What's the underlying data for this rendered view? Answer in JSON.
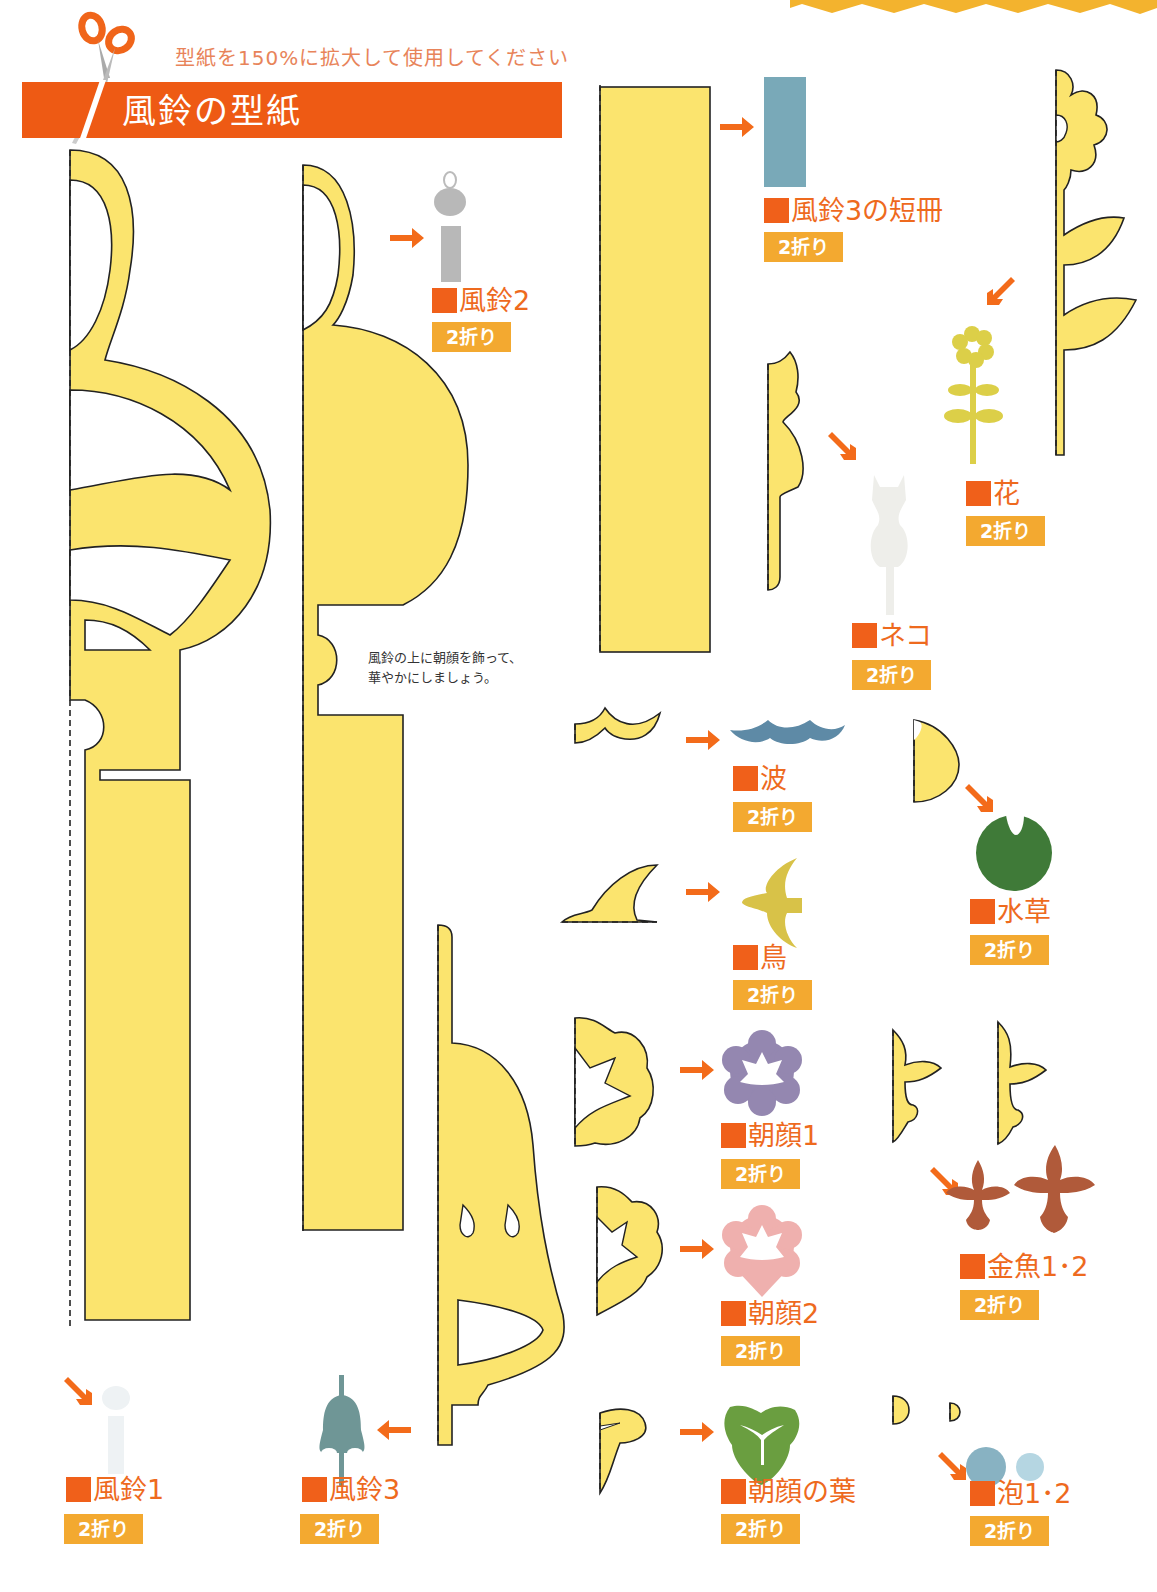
{
  "header": {
    "instruction": "型紙を150%に拡大して使用してください",
    "title": "風鈴の型紙",
    "icon": "scissors-icon"
  },
  "note": {
    "text": "風鈴の上に朝顔を飾って、\n華やかにしましょう。"
  },
  "fold_label": "2折り",
  "colors": {
    "template_fill": "#fbe46e",
    "title_band": "#ee5a14",
    "label_orange": "#ee6a1e",
    "badge": "#f3a930",
    "arrow": "#f36b1a"
  },
  "items": [
    {
      "id": "furin1",
      "label": "風鈴1",
      "fold": "2折り",
      "preview_color": "#eef2f4"
    },
    {
      "id": "furin2",
      "label": "風鈴2",
      "fold": "2折り",
      "preview_color": "#b8b8b8"
    },
    {
      "id": "furin3",
      "label": "風鈴3",
      "fold": "2折り",
      "preview_color": "#6f9696"
    },
    {
      "id": "tanzaku",
      "label": "風鈴3の短冊",
      "fold": "2折り",
      "preview_color": "#79a9b8"
    },
    {
      "id": "hana",
      "label": "花",
      "fold": "2折り",
      "preview_color": "#dccf48"
    },
    {
      "id": "neko",
      "label": "ネコ",
      "fold": "2折り",
      "preview_color": "#eeeeea"
    },
    {
      "id": "nami",
      "label": "波",
      "fold": "2折り",
      "preview_color": "#5e8aa6"
    },
    {
      "id": "mizukusa",
      "label": "水草",
      "fold": "2折り",
      "preview_color": "#3f7a38"
    },
    {
      "id": "tori",
      "label": "鳥",
      "fold": "2折り",
      "preview_color": "#d8c248"
    },
    {
      "id": "asagao1",
      "label": "朝顔1",
      "fold": "2折り",
      "preview_color": "#9487b0"
    },
    {
      "id": "asagao2",
      "label": "朝顔2",
      "fold": "2折り",
      "preview_color": "#efb0ae"
    },
    {
      "id": "kingyo",
      "label": "金魚1･2",
      "fold": "2折り",
      "preview_color": "#b05a3a"
    },
    {
      "id": "asagao_ha",
      "label": "朝顔の葉",
      "fold": "2折り",
      "preview_color": "#6a9e40"
    },
    {
      "id": "awa",
      "label": "泡1･2",
      "fold": "2折り",
      "preview_color": "#88b2c2"
    }
  ]
}
